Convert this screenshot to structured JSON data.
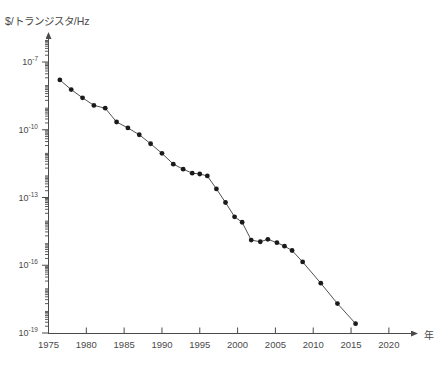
{
  "figure": {
    "clipped_header_text": "",
    "y_axis_unit_label": "$/トランジスタ/Hz",
    "x_axis_name": "年"
  },
  "chart_data": {
    "type": "line",
    "title": "",
    "subtitle": "",
    "xlabel": "年",
    "ylabel": "$/トランジスタ/Hz",
    "yscale": "log",
    "xlim": [
      1975,
      2022
    ],
    "ylim": [
      1e-19,
      1e-06
    ],
    "grid": false,
    "legend": null,
    "x_ticks": [
      1975,
      1980,
      1985,
      1990,
      1995,
      2000,
      2005,
      2010,
      2015,
      2020
    ],
    "x_tick_labels": [
      "1975",
      "1980",
      "1985",
      "1990",
      "1995",
      "2000",
      "2005",
      "2010",
      "2015",
      "2020"
    ],
    "y_ticks": [
      1e-07,
      1e-10,
      1e-13,
      1e-16,
      1e-19
    ],
    "y_tick_labels": [
      "10⁻⁷",
      "10⁻¹⁰",
      "10⁻¹³",
      "10⁻¹⁶",
      "10⁻¹⁹"
    ],
    "y_tick_mantissas": [
      "10",
      "10",
      "10",
      "10",
      "10"
    ],
    "y_tick_exponents": [
      "-7",
      "-10",
      "-13",
      "-16",
      "-19"
    ],
    "series": [
      {
        "name": "cost per transistor per Hz",
        "marker": "filled-circle",
        "points": [
          {
            "x": 1976.5,
            "y": 1.6e-08
          },
          {
            "x": 1978.0,
            "y": 6e-09
          },
          {
            "x": 1979.5,
            "y": 2.6e-09
          },
          {
            "x": 1981.0,
            "y": 1.2e-09
          },
          {
            "x": 1982.5,
            "y": 9e-10
          },
          {
            "x": 1984.0,
            "y": 2.2e-10
          },
          {
            "x": 1985.5,
            "y": 1.2e-10
          },
          {
            "x": 1987.0,
            "y": 6e-11
          },
          {
            "x": 1988.5,
            "y": 2.4e-11
          },
          {
            "x": 1990.0,
            "y": 9e-12
          },
          {
            "x": 1991.5,
            "y": 3e-12
          },
          {
            "x": 1992.8,
            "y": 1.8e-12
          },
          {
            "x": 1994.0,
            "y": 1.2e-12
          },
          {
            "x": 1995.0,
            "y": 1.1e-12
          },
          {
            "x": 1996.0,
            "y": 9e-13
          },
          {
            "x": 1997.2,
            "y": 2.4e-13
          },
          {
            "x": 1998.4,
            "y": 6e-14
          },
          {
            "x": 1999.6,
            "y": 1.4e-14
          },
          {
            "x": 2000.6,
            "y": 8e-15
          },
          {
            "x": 2001.8,
            "y": 1.3e-15
          },
          {
            "x": 2003.0,
            "y": 1.1e-15
          },
          {
            "x": 2004.0,
            "y": 1.4e-15
          },
          {
            "x": 2005.2,
            "y": 1e-15
          },
          {
            "x": 2006.2,
            "y": 7e-16
          },
          {
            "x": 2007.2,
            "y": 4.5e-16
          },
          {
            "x": 2008.6,
            "y": 1.4e-16
          },
          {
            "x": 2011.0,
            "y": 1.6e-17
          },
          {
            "x": 2013.2,
            "y": 2e-18
          },
          {
            "x": 2015.6,
            "y": 2.6e-19
          }
        ]
      }
    ]
  }
}
